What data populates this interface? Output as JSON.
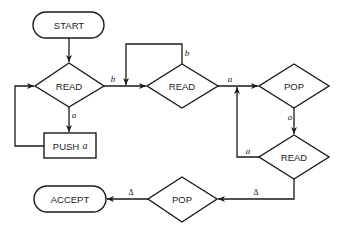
{
  "diagram": {
    "type": "flowchart",
    "colors": {
      "stroke": "#1a1a1a",
      "background": "#ffffff"
    },
    "nodes": {
      "start": {
        "label": "START",
        "shape": "terminal"
      },
      "read1": {
        "label": "READ",
        "shape": "decision"
      },
      "push": {
        "label": "PUSH",
        "arg": "a",
        "shape": "process"
      },
      "read2": {
        "label": "READ",
        "shape": "decision"
      },
      "pop1": {
        "label": "POP",
        "shape": "decision"
      },
      "read3": {
        "label": "READ",
        "shape": "decision"
      },
      "pop2": {
        "label": "POP",
        "shape": "decision"
      },
      "accept": {
        "label": "ACCEPT",
        "shape": "terminal"
      }
    },
    "edges": {
      "read1_to_read2": "b",
      "read1_to_push": "a",
      "read2_self": "b",
      "read2_to_pop1": "a",
      "pop1_to_read3": "a",
      "read3_to_loop": "a",
      "read3_to_pop2": "Δ",
      "pop2_to_accept": "Δ"
    }
  }
}
